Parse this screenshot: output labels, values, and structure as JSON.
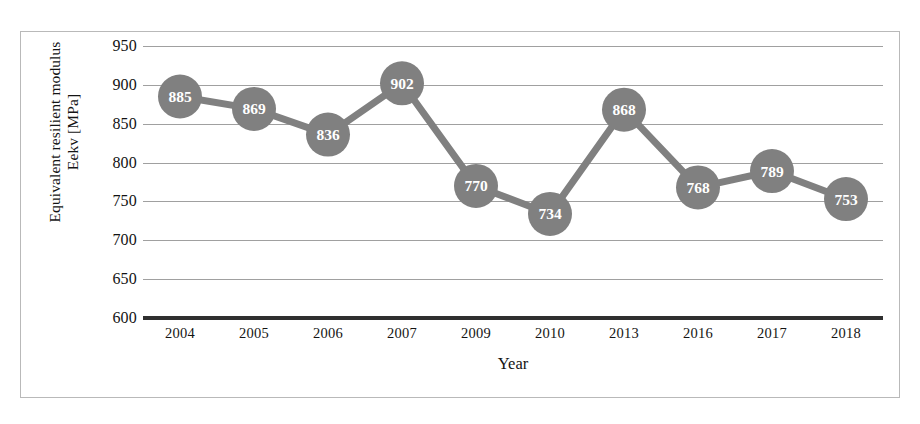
{
  "chart_data": {
    "type": "line",
    "title": "",
    "xlabel": "Year",
    "ylabel_line1": "Equivalent resilient modulus",
    "ylabel_line2": "Eekv [MPa]",
    "categories": [
      "2004",
      "2005",
      "2006",
      "2007",
      "2009",
      "2010",
      "2013",
      "2016",
      "2017",
      "2018"
    ],
    "values": [
      885,
      869,
      836,
      902,
      770,
      734,
      868,
      768,
      789,
      753
    ],
    "data_labels": [
      "885",
      "869",
      "836",
      "902",
      "770",
      "734",
      "868",
      "768",
      "789",
      "753"
    ],
    "ylim": [
      600,
      950
    ],
    "yticks": [
      950,
      900,
      850,
      800,
      750,
      700,
      650,
      600
    ],
    "ytick_labels": [
      "950",
      "900",
      "850",
      "800",
      "750",
      "700",
      "650",
      "600"
    ],
    "grid": true,
    "legend": "none",
    "marker": "circle",
    "series_color": "#808080",
    "marker_label_color": "#ffffff",
    "gridline_color": "#a0a0a0",
    "axis_color": "#2f2f2f"
  }
}
